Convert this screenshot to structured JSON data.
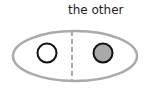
{
  "diagram": {
    "label": "the other",
    "colors": {
      "ellipse_stroke": "#aaaaaa",
      "divider_stroke": "#aaaaaa",
      "circle_stroke": "#111111",
      "left_circle_fill": "#ffffff",
      "right_circle_fill": "#a9a9a9"
    },
    "elements": [
      {
        "type": "ellipse",
        "name": "container-ellipse"
      },
      {
        "type": "dashed-line",
        "name": "center-divider"
      },
      {
        "type": "circle",
        "name": "left-circle",
        "fill": "empty"
      },
      {
        "type": "circle",
        "name": "right-circle",
        "fill": "filled"
      }
    ]
  }
}
